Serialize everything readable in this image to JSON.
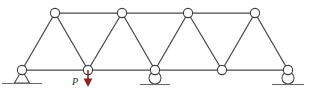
{
  "figure": {
    "type": "structural-truss-diagram",
    "width": 310,
    "height": 92,
    "background_color": "#ffffff"
  },
  "colors": {
    "member": "#4a4a4a",
    "joint_stroke": "#3d3d3d",
    "joint_fill": "#ffffff",
    "support": "#4a4a4a",
    "ground": "#6a6a6a",
    "load": "#8b2game",
    "load_arrow": "#8f2222",
    "label_text": "#2b2b2b"
  },
  "geometry": {
    "top_chord_y": 13,
    "bottom_chord_y": 70,
    "joint_radius": 4.6,
    "top_nodes": [
      {
        "id": "T1",
        "x": 55,
        "y": 13
      },
      {
        "id": "T2",
        "x": 122,
        "y": 13
      },
      {
        "id": "T3",
        "x": 188,
        "y": 13
      },
      {
        "id": "T4",
        "x": 255,
        "y": 13
      }
    ],
    "bottom_nodes": [
      {
        "id": "B1",
        "x": 22,
        "y": 70
      },
      {
        "id": "B2",
        "x": 88,
        "y": 70
      },
      {
        "id": "B3",
        "x": 155,
        "y": 70
      },
      {
        "id": "B4",
        "x": 222,
        "y": 70
      },
      {
        "id": "B5",
        "x": 288,
        "y": 70
      }
    ],
    "top_chord_members": [
      {
        "from": "T1",
        "to": "T2"
      },
      {
        "from": "T2",
        "to": "T3"
      },
      {
        "from": "T3",
        "to": "T4"
      }
    ],
    "bottom_chord_members": [
      {
        "from": "B1",
        "to": "B2"
      },
      {
        "from": "B2",
        "to": "B3"
      },
      {
        "from": "B3",
        "to": "B4"
      },
      {
        "from": "B4",
        "to": "B5"
      }
    ],
    "diagonal_members": [
      {
        "from": "B1",
        "to": "T1"
      },
      {
        "from": "T1",
        "to": "B2"
      },
      {
        "from": "B2",
        "to": "T2"
      },
      {
        "from": "T2",
        "to": "B3"
      },
      {
        "from": "B3",
        "to": "T3"
      },
      {
        "from": "T3",
        "to": "B4"
      },
      {
        "from": "B4",
        "to": "T4"
      },
      {
        "from": "T4",
        "to": "B5"
      }
    ]
  },
  "supports": [
    {
      "id": "support-left",
      "kind": "pin",
      "at_node": "B1",
      "x": 22,
      "y": 70,
      "ground_line_y": 84,
      "ground_line_half_width": 20
    },
    {
      "id": "support-middle",
      "kind": "roller",
      "at_node": "B3",
      "x": 155,
      "y": 70,
      "ground_line_y": 84,
      "ground_line_half_width": 15
    },
    {
      "id": "support-right",
      "kind": "roller",
      "at_node": "B5",
      "x": 288,
      "y": 70,
      "ground_line_y": 84,
      "ground_line_half_width": 16
    }
  ],
  "loads": [
    {
      "id": "load-P",
      "label": "P",
      "direction": "down",
      "applied_at_node": "B2",
      "x": 88,
      "tail_y": 70,
      "head_y": 86,
      "color": "#8f2222",
      "label_x": 73,
      "label_y": 83
    }
  ]
}
